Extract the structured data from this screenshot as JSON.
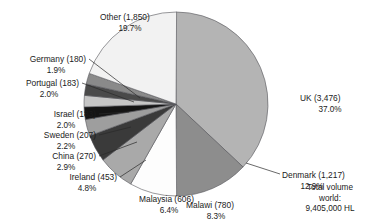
{
  "chart_data": {
    "type": "pie",
    "title": "",
    "legend": "none",
    "value_unit": "thousand HL",
    "categories": [
      "UK",
      "Denmark",
      "Malawi",
      "Malaysia",
      "Ireland",
      "China",
      "Sweden",
      "Israel",
      "Portugal",
      "Germany",
      "Other"
    ],
    "values": [
      3476,
      1217,
      780,
      606,
      453,
      270,
      207,
      183,
      183,
      180,
      1850
    ],
    "percentages": [
      37.0,
      12.9,
      8.3,
      6.4,
      4.8,
      2.9,
      2.2,
      2.0,
      2.0,
      1.9,
      19.7
    ],
    "slice_colors": [
      "#b4b4b4",
      "#8d8d8d",
      "#fdfdfd",
      "#a9a9a9",
      "#3a3a3a",
      "#9e9e9e",
      "#141414",
      "#c6c6c6",
      "#4a4a4a",
      "#8a8a8a",
      "#f2f2f2"
    ],
    "start_angle_deg": 0,
    "direction": "clockwise",
    "slices": [
      {
        "name": "UK",
        "value": 3476,
        "percent": 37.0,
        "label_line1": "UK (3,476)",
        "label_line2": "37.0%",
        "color": "#b4b4b4"
      },
      {
        "name": "Denmark",
        "value": 1217,
        "percent": 12.9,
        "label_line1": "Denmark (1,217)",
        "label_line2": "12.9%",
        "color": "#8d8d8d"
      },
      {
        "name": "Malawi",
        "value": 780,
        "percent": 8.3,
        "label_line1": "Malawi (780)",
        "label_line2": "8.3%",
        "color": "#fdfdfd"
      },
      {
        "name": "Malaysia",
        "value": 606,
        "percent": 6.4,
        "label_line1": "Malaysia (606)",
        "label_line2": "6.4%",
        "color": "#a9a9a9"
      },
      {
        "name": "Ireland",
        "value": 453,
        "percent": 4.8,
        "label_line1": "Ireland (453)",
        "label_line2": "4.8%",
        "color": "#3a3a3a"
      },
      {
        "name": "China",
        "value": 270,
        "percent": 2.9,
        "label_line1": "China (270)",
        "label_line2": "2.9%",
        "color": "#9e9e9e"
      },
      {
        "name": "Sweden",
        "value": 207,
        "percent": 2.2,
        "label_line1": "Sweden (207)",
        "label_line2": "2.2%",
        "color": "#141414"
      },
      {
        "name": "Israel",
        "value": 183,
        "percent": 2.0,
        "label_line1": "Israel (183)",
        "label_line2": "2.0%",
        "color": "#c6c6c6"
      },
      {
        "name": "Portugal",
        "value": 183,
        "percent": 2.0,
        "label_line1": "Portugal (183)",
        "label_line2": "2.0%",
        "color": "#4a4a4a"
      },
      {
        "name": "Germany",
        "value": 180,
        "percent": 1.9,
        "label_line1": "Germany (180)",
        "label_line2": "1.9%",
        "color": "#8a8a8a"
      },
      {
        "name": "Other",
        "value": 1850,
        "percent": 19.7,
        "label_line1": "Other (1,850)",
        "label_line2": "19.7%",
        "color": "#f2f2f2"
      }
    ]
  },
  "annotation": {
    "line1": "Total volume",
    "line2": "world:",
    "line3": "9,405,000 HL"
  }
}
